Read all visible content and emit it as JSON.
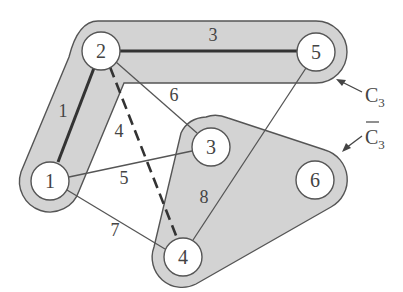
{
  "diagram": {
    "type": "graph-cut",
    "regions": [
      {
        "id": "C3",
        "label": "C",
        "subscript": "3",
        "overline": false,
        "nodes": [
          "2",
          "5",
          "1"
        ]
      },
      {
        "id": "C3bar",
        "label": "C",
        "subscript": "3",
        "overline": true,
        "nodes": [
          "3",
          "6",
          "4"
        ]
      }
    ],
    "nodes": [
      {
        "id": "1",
        "label": "1"
      },
      {
        "id": "2",
        "label": "2"
      },
      {
        "id": "3",
        "label": "3"
      },
      {
        "id": "4",
        "label": "4"
      },
      {
        "id": "5",
        "label": "5"
      },
      {
        "id": "6",
        "label": "6"
      }
    ],
    "edges": [
      {
        "from": "2",
        "to": "1",
        "weight": "1",
        "style": "bold"
      },
      {
        "from": "2",
        "to": "5",
        "weight": "3",
        "style": "bold"
      },
      {
        "from": "2",
        "to": "4",
        "weight": "4",
        "style": "dashed"
      },
      {
        "from": "1",
        "to": "3",
        "weight": "5",
        "style": "thin"
      },
      {
        "from": "2",
        "to": "3",
        "weight": "6",
        "style": "thin"
      },
      {
        "from": "1",
        "to": "4",
        "weight": "7",
        "style": "thin"
      },
      {
        "from": "5",
        "to": "4",
        "weight": "8",
        "style": "thin"
      }
    ]
  }
}
